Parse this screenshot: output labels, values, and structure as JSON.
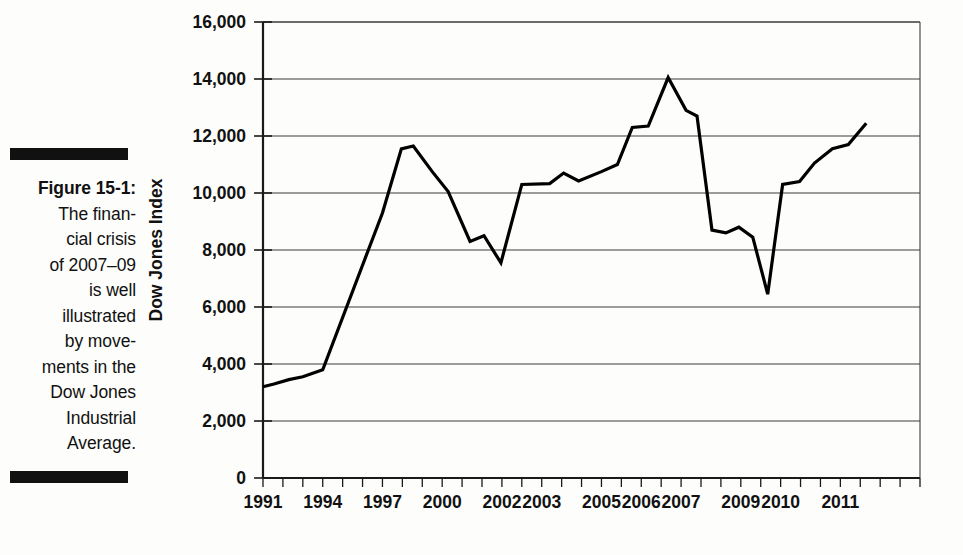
{
  "caption": {
    "figure_label": "Figure 15-1:",
    "lines": [
      "The finan-",
      "cial crisis",
      "of 2007–09",
      "is well",
      "illustrated",
      "by move-",
      "ments in the",
      "Dow Jones",
      "Industrial",
      "Average."
    ]
  },
  "colors": {
    "line": "#000000",
    "grid": "#3d3d3d",
    "axis": "#1a1a1a",
    "text": "#111111",
    "background": "#fdfdfb"
  },
  "chart_data": {
    "type": "line",
    "title": "",
    "subtitle": "",
    "xlabel": "",
    "ylabel": "Dow Jones Index",
    "ylim": [
      0,
      16000
    ],
    "ytick_labels": [
      "0",
      "2,000",
      "4,000",
      "6,000",
      "8,000",
      "10,000",
      "12,000",
      "14,000",
      "16,000"
    ],
    "ytick_values": [
      0,
      2000,
      4000,
      6000,
      8000,
      10000,
      12000,
      14000,
      16000
    ],
    "xtick_labels": [
      "1991",
      "1994",
      "1997",
      "2000",
      "2002",
      "2003",
      "2005",
      "2006",
      "2007",
      "2009",
      "2010",
      "2011"
    ],
    "xtick_positions": [
      0,
      3,
      6,
      9,
      12,
      14,
      17,
      19,
      21,
      24,
      26,
      29
    ],
    "x_minor_tick_count": 33,
    "grid": "horizontal",
    "legend": "none",
    "series": [
      {
        "name": "Dow Jones Industrial Average",
        "x": [
          0,
          1,
          2,
          3,
          4,
          5,
          6,
          7,
          8,
          9,
          10,
          11,
          12,
          13,
          14,
          15,
          16,
          17,
          18,
          19,
          20,
          21,
          22,
          23,
          24,
          25,
          26,
          27,
          28,
          29,
          30,
          31
        ],
        "values": [
          3200,
          3350,
          3500,
          3800,
          6000,
          8200,
          9300,
          11550,
          11650,
          10500,
          10050,
          8300,
          8500,
          7550,
          10300,
          10330,
          10350,
          10600,
          10400,
          10900,
          11000,
          12300,
          12400,
          14050,
          12900,
          12700,
          8700,
          8800,
          8500,
          6450,
          10300,
          10400
        ],
        "note": "approximate yearly/semi-annual index level read from the plotted line"
      }
    ],
    "series_tail": {
      "x": [
        31,
        32,
        33
      ],
      "values": [
        10400,
        11000,
        11600
      ]
    },
    "key_points": [
      {
        "label": "start 1991",
        "value": 3200
      },
      {
        "label": "2000 peak",
        "value": 11650
      },
      {
        "label": "2003 low",
        "value": 7550
      },
      {
        "label": "2007 peak",
        "value": 14050
      },
      {
        "label": "2009 trough",
        "value": 6450
      },
      {
        "label": "2011 end",
        "value": 12450
      }
    ]
  },
  "line_points": [
    [
      0.0,
      3200
    ],
    [
      0.55,
      3300
    ],
    [
      1.3,
      3450
    ],
    [
      2.0,
      3550
    ],
    [
      3.0,
      3800
    ],
    [
      6.0,
      9300
    ],
    [
      6.95,
      11550
    ],
    [
      7.55,
      11650
    ],
    [
      8.5,
      10750
    ],
    [
      9.3,
      10050
    ],
    [
      10.4,
      8300
    ],
    [
      11.1,
      8500
    ],
    [
      11.95,
      7550
    ],
    [
      13.0,
      10300
    ],
    [
      14.4,
      10330
    ],
    [
      15.1,
      10700
    ],
    [
      15.85,
      10420
    ],
    [
      17.0,
      10750
    ],
    [
      17.8,
      11000
    ],
    [
      18.55,
      12300
    ],
    [
      19.35,
      12350
    ],
    [
      20.35,
      14050
    ],
    [
      21.25,
      12900
    ],
    [
      21.8,
      12700
    ],
    [
      22.55,
      8700
    ],
    [
      23.25,
      8600
    ],
    [
      23.9,
      8800
    ],
    [
      24.6,
      8450
    ],
    [
      25.35,
      6450
    ],
    [
      26.1,
      10300
    ],
    [
      26.95,
      10400
    ],
    [
      27.7,
      11050
    ],
    [
      28.6,
      11550
    ],
    [
      29.4,
      11700
    ],
    [
      30.3,
      12450
    ]
  ]
}
